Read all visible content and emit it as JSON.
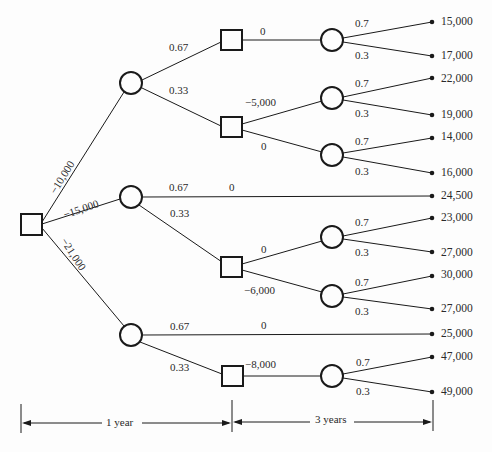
{
  "diagram": {
    "type": "decision-tree",
    "root_branches": [
      {
        "label": "−10,000"
      },
      {
        "label": "−15,000"
      },
      {
        "label": "−21,000"
      }
    ],
    "first_chance_probs": {
      "a_high": "0.67",
      "a_low": "0.33",
      "b_high": "0.67",
      "b_low": "0.33",
      "c_high": "0.67",
      "c_low": "0.33"
    },
    "second_decision_labels": {
      "a1": "0",
      "a2_up": "−5,000",
      "a2_down": "0",
      "b_straight": "0",
      "b2_up": "0",
      "b2_down": "−6,000",
      "c_straight": "0",
      "c2": "−8,000"
    },
    "second_chance_probs": {
      "high": "0.7",
      "low": "0.3"
    },
    "payoffs": [
      "15,000",
      "17,000",
      "22,000",
      "19,000",
      "14,000",
      "16,000",
      "24,500",
      "23,000",
      "27,000",
      "30,000",
      "27,000",
      "25,000",
      "47,000",
      "49,000"
    ],
    "timeline": {
      "period1": "1 year",
      "period2": "3 years"
    }
  }
}
